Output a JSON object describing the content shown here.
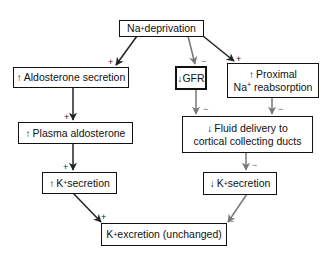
{
  "diagram": {
    "nodes": {
      "na_deprivation": {
        "prefix": "Na",
        "sup": "+",
        "text": " deprivation"
      },
      "aldo_secretion": {
        "icon": "↑",
        "icon_name": "up-arrow-icon",
        "text": "Aldosterone secretion"
      },
      "gfr": {
        "icon": "↓",
        "icon_name": "down-arrow-icon",
        "text": "GFR"
      },
      "proximal": {
        "icon": "↑",
        "line1": "Proximal",
        "prefix": "Na",
        "sup": "+",
        "line2": " reabsorption"
      },
      "plasma_aldo": {
        "icon": "↑",
        "text": "Plasma aldosterone"
      },
      "fluid_delivery": {
        "icon": "↓",
        "line1": "Fluid delivery to",
        "line2": "cortical collecting ducts"
      },
      "k_secretion_up": {
        "icon": "↑",
        "prefix": "K",
        "sup": "+",
        "text": " secretion"
      },
      "k_secretion_down": {
        "icon": "↓",
        "prefix": "K",
        "sup": "+",
        "text": " secretion"
      },
      "k_excretion": {
        "prefix": "K",
        "sup": "+",
        "text": " excretion (unchanged)"
      }
    },
    "signs": {
      "to_aldo": "+",
      "to_gfr": "−",
      "to_proximal": "+",
      "to_plasma": "+",
      "gfr_to_fluid": "−",
      "prox_to_fluid": "−",
      "to_ksec_up": "+",
      "to_ksec_down": "−",
      "up_to_excretion": "+",
      "down_to_excretion": "−"
    },
    "colors": {
      "positive": "#222222",
      "negative": "#777777"
    }
  }
}
